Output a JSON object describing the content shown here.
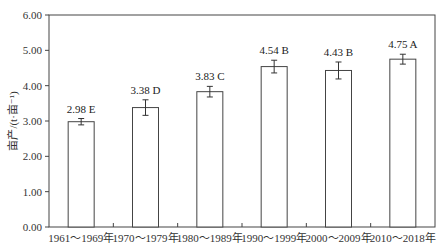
{
  "chart_data": {
    "type": "bar",
    "title": "",
    "xlabel": "",
    "ylabel": "亩产/(t·亩⁻¹)",
    "ylim": [
      0,
      6
    ],
    "yticks": [
      "0.00",
      "1.00",
      "2.00",
      "3.00",
      "4.00",
      "5.00",
      "6.00"
    ],
    "grid": false,
    "legend": null,
    "categories": [
      "1961～1969年",
      "1970～1979年",
      "1980～1989年",
      "1990～1999年",
      "2000～2009年",
      "2010～2018年"
    ],
    "values": [
      2.98,
      3.38,
      3.83,
      4.54,
      4.43,
      4.75
    ],
    "errors": [
      0.09,
      0.22,
      0.15,
      0.18,
      0.24,
      0.14
    ],
    "significance": [
      "E",
      "D",
      "C",
      "B",
      "B",
      "A"
    ],
    "bar_labels": [
      "2.98 E",
      "3.38 D",
      "3.83 C",
      "4.54 B",
      "4.43 B",
      "4.75 A"
    ],
    "colors": {
      "bar_fill": "#ffffff",
      "bar_stroke": "#444444",
      "axis": "#444444"
    }
  }
}
